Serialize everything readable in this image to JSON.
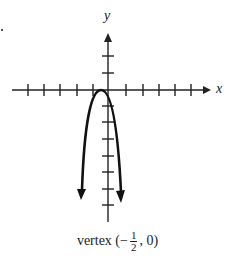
{
  "graph": {
    "x_axis_label": "x",
    "y_axis_label": "y",
    "caption": {
      "prefix": "vertex (",
      "sign": "−",
      "numerator": "1",
      "denominator": "2",
      "suffix": ", 0)"
    },
    "vertex": {
      "x": -0.5,
      "y": 0
    },
    "curve": "downward-opening parabola"
  }
}
